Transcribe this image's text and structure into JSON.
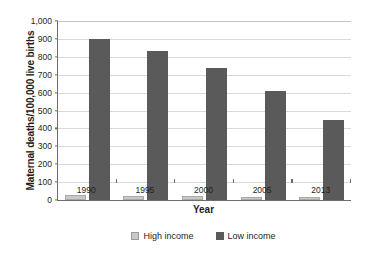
{
  "chart_data": {
    "type": "bar",
    "title": "",
    "xlabel": "Year",
    "ylabel": "Maternal deaths/100,000 live births",
    "categories": [
      "1990",
      "1995",
      "2000",
      "2005",
      "2013"
    ],
    "series": [
      {
        "name": "High income",
        "color": "#c8c8c8",
        "values": [
          26,
          21,
          20,
          16,
          19
        ]
      },
      {
        "name": "Low income",
        "color": "#5a5a5a",
        "values": [
          898,
          835,
          735,
          608,
          447
        ]
      }
    ],
    "ylim": [
      0,
      1000
    ],
    "ytick_labels": [
      "0",
      "100",
      "200",
      "300",
      "400",
      "500",
      "600",
      "700",
      "800",
      "900",
      "1,000"
    ],
    "ytick_values": [
      0,
      100,
      200,
      300,
      400,
      500,
      600,
      700,
      800,
      900,
      1000
    ],
    "grid": true,
    "legend_position": "bottom",
    "legend": [
      "High income",
      "Low income"
    ],
    "annotations": []
  }
}
